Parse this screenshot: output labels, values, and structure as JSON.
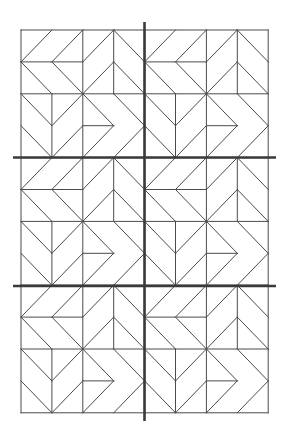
{
  "colors": {
    "background": "#ffffff",
    "thin_line": "#4a4a4a",
    "thick_line": "#3a3a3a"
  },
  "layout": {
    "origin_x": 21,
    "origin_y": 30,
    "block_cols": 2,
    "block_rows": 3,
    "cell_w": 30.9,
    "cell_h": 31.9,
    "grid_units_per_block": 4
  },
  "block_lines": [
    [
      0,
      0,
      4,
      0
    ],
    [
      0,
      2,
      4,
      2
    ],
    [
      0,
      4,
      4,
      4
    ],
    [
      0,
      0,
      0,
      4
    ],
    [
      2,
      0,
      2,
      4
    ],
    [
      4,
      0,
      4,
      4
    ],
    [
      0,
      1,
      2,
      1
    ],
    [
      0,
      1,
      1,
      0
    ],
    [
      1,
      1,
      2,
      0
    ],
    [
      0,
      1,
      1,
      2
    ],
    [
      1,
      1,
      2,
      2
    ],
    [
      3,
      0,
      3,
      2
    ],
    [
      2,
      1,
      3,
      0
    ],
    [
      3,
      0,
      4,
      1
    ],
    [
      2,
      2,
      3,
      1
    ],
    [
      3,
      1,
      4,
      2
    ],
    [
      1,
      2,
      1,
      4
    ],
    [
      0,
      2,
      1,
      3
    ],
    [
      1,
      3,
      2,
      2
    ],
    [
      0,
      3,
      1,
      4
    ],
    [
      1,
      4,
      2,
      3
    ],
    [
      2,
      3,
      3,
      3
    ],
    [
      2,
      2,
      3,
      3
    ],
    [
      3,
      2,
      4,
      3
    ],
    [
      3,
      3,
      2,
      4
    ],
    [
      4,
      3,
      3,
      4
    ]
  ],
  "divider_lines": {
    "vertical": {
      "x": 144.5,
      "y1": 22,
      "y2": 421
    },
    "horizontal": [
      {
        "y": 157.5,
        "x1": 13,
        "x2": 276
      },
      {
        "y": 286,
        "x1": 13,
        "x2": 276
      }
    ]
  }
}
